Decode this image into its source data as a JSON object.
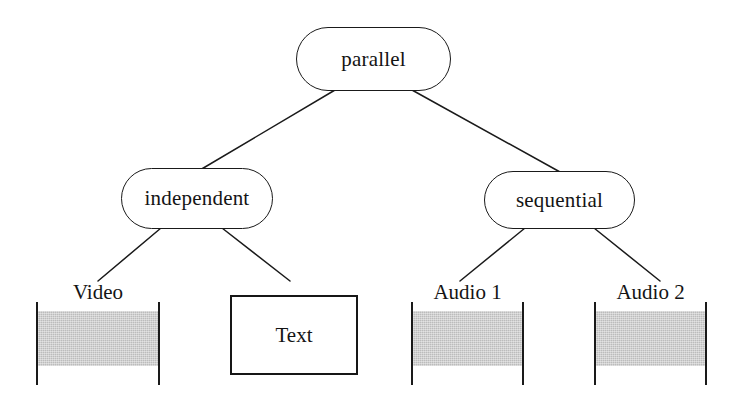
{
  "diagram": {
    "colors": {
      "stroke": "#1a1a1a",
      "band_gray": "#bcbcbc",
      "background": "#ffffff"
    },
    "nodes": {
      "root": {
        "label": "parallel",
        "shape": "rounded-pill"
      },
      "left_branch": {
        "label": "independent",
        "shape": "rounded-pill"
      },
      "right_branch": {
        "label": "sequential",
        "shape": "rounded-pill"
      }
    },
    "leaves": {
      "video": {
        "label": "Video",
        "shape": "media-track-band"
      },
      "text": {
        "label": "Text",
        "shape": "rectangle"
      },
      "audio1": {
        "label": "Audio 1",
        "shape": "media-track-band"
      },
      "audio2": {
        "label": "Audio 2",
        "shape": "media-track-band"
      }
    },
    "edges": [
      {
        "from": "parallel",
        "to": "independent"
      },
      {
        "from": "parallel",
        "to": "sequential"
      },
      {
        "from": "independent",
        "to": "Video"
      },
      {
        "from": "independent",
        "to": "Text"
      },
      {
        "from": "sequential",
        "to": "Audio 1"
      },
      {
        "from": "sequential",
        "to": "Audio 2"
      }
    ]
  }
}
